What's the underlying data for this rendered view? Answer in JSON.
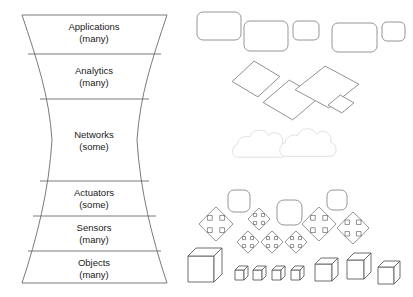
{
  "diagram": {
    "background_color": "#ffffff",
    "stroke_color": "#6b6b6b",
    "text_color": "#1a1a1a",
    "hourglass": {
      "name": "hourglass-stack",
      "layers": [
        {
          "id": "applications",
          "label": "Applications",
          "qualifier": "(many)",
          "cx": 94,
          "cy": 32
        },
        {
          "id": "analytics",
          "label": "Analytics",
          "qualifier": "(many)",
          "cx": 94,
          "cy": 76
        },
        {
          "id": "networks",
          "label": "Networks",
          "qualifier": "(some)",
          "cx": 94,
          "cy": 140
        },
        {
          "id": "actuators",
          "label": "Actuators",
          "qualifier": "(some)",
          "cx": 94,
          "cy": 198
        },
        {
          "id": "sensors",
          "label": "Sensors",
          "qualifier": "(many)",
          "cx": 94,
          "cy": 233
        },
        {
          "id": "objects",
          "label": "Objects",
          "qualifier": "(many)",
          "cx": 94,
          "cy": 268
        }
      ],
      "outline_path": "M22,15 L167,15 C152,60 140,95 137,140 C140,190 152,238 167,283 L22,283 C37,238 49,190 52,140 C49,95 37,60 22,15 Z",
      "dividers": [
        "M28,54 L161,54",
        "M40,99 L149,99",
        "M40,181 L149,181",
        "M33,216 L156,216",
        "M28,251 L161,251"
      ]
    },
    "illustration": {
      "name": "device-icon-cloud",
      "rounded_rects": {
        "group_name": "application-rectangles",
        "stroke": "#8a8a8a",
        "items": [
          {
            "x": 197,
            "y": 12,
            "w": 44,
            "h": 28,
            "r": 6
          },
          {
            "x": 244,
            "y": 21,
            "w": 44,
            "h": 30,
            "r": 6
          },
          {
            "x": 293,
            "y": 21,
            "w": 26,
            "h": 19,
            "r": 5
          },
          {
            "x": 332,
            "y": 23,
            "w": 45,
            "h": 29,
            "r": 6
          },
          {
            "x": 382,
            "y": 22,
            "w": 23,
            "h": 19,
            "r": 5
          }
        ]
      },
      "diamonds": {
        "group_name": "analytics-diamonds",
        "stroke": "#8a8a8a",
        "items": [
          {
            "cx": 256,
            "cy": 79,
            "rx": 24,
            "ry": 18,
            "rot": -6
          },
          {
            "cx": 291,
            "cy": 100,
            "rx": 28,
            "ry": 20,
            "rot": -5
          },
          {
            "cx": 327,
            "cy": 87,
            "rx": 32,
            "ry": 21,
            "rot": -5
          },
          {
            "cx": 341,
            "cy": 104,
            "rx": 13,
            "ry": 9,
            "rot": -5
          }
        ]
      },
      "clouds": {
        "group_name": "network-clouds",
        "stroke": "#dcdcdc",
        "items": [
          {
            "cx": 262,
            "cy": 150,
            "scale": 1.0
          },
          {
            "cx": 310,
            "cy": 149,
            "scale": 1.02
          }
        ]
      },
      "rounded_squares": {
        "group_name": "actuator-squares",
        "stroke": "#8a8a8a",
        "items": [
          {
            "x": 228,
            "y": 190,
            "w": 22,
            "h": 22,
            "r": 6
          },
          {
            "x": 277,
            "y": 200,
            "w": 25,
            "h": 25,
            "r": 7
          },
          {
            "x": 327,
            "y": 190,
            "w": 20,
            "h": 20,
            "r": 6
          }
        ]
      },
      "bursts": {
        "group_name": "sensor-bursts",
        "stroke": "#7a7a7a",
        "items": [
          {
            "cx": 216,
            "cy": 224,
            "s": 17
          },
          {
            "cx": 259,
            "cy": 219,
            "s": 11
          },
          {
            "cx": 319,
            "cy": 224,
            "s": 17
          },
          {
            "cx": 353,
            "cy": 228,
            "s": 16
          },
          {
            "cx": 248,
            "cy": 242,
            "s": 11
          },
          {
            "cx": 272,
            "cy": 242,
            "s": 11
          },
          {
            "cx": 296,
            "cy": 242,
            "s": 11
          }
        ]
      },
      "cubes": {
        "group_name": "object-cubes",
        "stroke": "#5f5f5f",
        "items": [
          {
            "x": 188,
            "y": 248,
            "w": 26,
            "h": 26,
            "d": 8
          },
          {
            "x": 235,
            "y": 266,
            "w": 9,
            "h": 10,
            "d": 4
          },
          {
            "x": 253,
            "y": 266,
            "w": 9,
            "h": 10,
            "d": 4
          },
          {
            "x": 272,
            "y": 266,
            "w": 9,
            "h": 10,
            "d": 4
          },
          {
            "x": 291,
            "y": 266,
            "w": 9,
            "h": 10,
            "d": 4
          },
          {
            "x": 315,
            "y": 258,
            "w": 17,
            "h": 17,
            "d": 6
          },
          {
            "x": 347,
            "y": 253,
            "w": 17,
            "h": 19,
            "d": 7
          },
          {
            "x": 378,
            "y": 261,
            "w": 16,
            "h": 17,
            "d": 6
          }
        ]
      }
    }
  }
}
